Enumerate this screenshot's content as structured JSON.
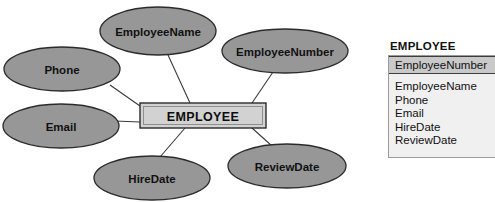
{
  "diagram": {
    "type": "entity-relationship-attribute-diagram",
    "entity": {
      "name": "EMPLOYEE",
      "shape": "rectangle",
      "cx": 203,
      "cy": 115.5,
      "x": 140,
      "y": 103,
      "width": 126,
      "height": 25,
      "fill": "#d2d2d2",
      "stroke": "#2b2b2b"
    },
    "attributes": [
      {
        "label": "EmployeeName",
        "cx": 158,
        "cy": 31,
        "rx": 58,
        "ry": 24,
        "anchor_x": 190,
        "anchor_y": 103
      },
      {
        "label": "EmployeeNumber",
        "cx": 285,
        "cy": 51,
        "rx": 63,
        "ry": 22,
        "anchor_x": 252,
        "anchor_y": 103
      },
      {
        "label": "Phone",
        "cx": 62,
        "cy": 69,
        "rx": 58,
        "ry": 22,
        "anchor_x": 140,
        "anchor_y": 106
      },
      {
        "label": "Email",
        "cx": 61,
        "cy": 126,
        "rx": 58,
        "ry": 22,
        "anchor_x": 140,
        "anchor_y": 122
      },
      {
        "label": "HireDate",
        "cx": 152,
        "cy": 178,
        "rx": 58,
        "ry": 22,
        "anchor_x": 185,
        "anchor_y": 128
      },
      {
        "label": "ReviewDate",
        "cx": 287,
        "cy": 166,
        "rx": 59,
        "ry": 22,
        "anchor_x": 252,
        "anchor_y": 128
      }
    ],
    "colors": {
      "attribute_fill": "#979797",
      "attribute_stroke": "#2b2b2b",
      "entity_fill": "#d2d2d2",
      "line": "#3a3a3a",
      "background": "#ffffff"
    }
  },
  "table": {
    "title": "EMPLOYEE",
    "key_field": "EmployeeNumber",
    "fields": [
      "EmployeeName",
      "Phone",
      "Email",
      "HireDate",
      "ReviewDate"
    ],
    "colors": {
      "key_row_fill": "#c9c9c9",
      "body_fill": "#f0f0f0",
      "border": "#9a9a9a"
    }
  }
}
